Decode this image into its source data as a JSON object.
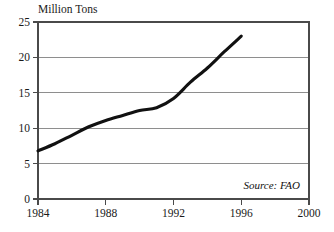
{
  "chart_data": {
    "type": "line",
    "title": "",
    "subtitle": "",
    "xlabel": "",
    "ylabel": "Million Tons",
    "ylabel_position": "top-left-above-axis",
    "xlim": [
      1984,
      2000
    ],
    "ylim": [
      0,
      25
    ],
    "grid": "horizontal",
    "legend": "none",
    "x": [
      1984,
      1985,
      1986,
      1987,
      1988,
      1989,
      1990,
      1991,
      1992,
      1993,
      1994,
      1995,
      1996
    ],
    "series": [
      {
        "name": "Production",
        "color": "#111111",
        "values": [
          6.8,
          7.8,
          9.0,
          10.2,
          11.1,
          11.8,
          12.5,
          12.9,
          14.2,
          16.5,
          18.5,
          20.8,
          23.0
        ]
      }
    ],
    "x_ticks": [
      1984,
      1988,
      1992,
      1996,
      2000
    ],
    "x_tick_labels": [
      "1984",
      "1988",
      "1992",
      "1996",
      "2000"
    ],
    "y_ticks": [
      0,
      5,
      10,
      15,
      20,
      25
    ],
    "y_tick_labels": [
      "0",
      "5",
      "10",
      "15",
      "20",
      "25"
    ],
    "annotations": [
      {
        "name": "source-note",
        "text": "Source: FAO",
        "style": "italic",
        "position": "bottom-right-inside-plot"
      }
    ]
  },
  "labels": {
    "y_axis_title": "Million Tons",
    "source": "Source: FAO",
    "y_0": "0",
    "y_5": "5",
    "y_10": "10",
    "y_15": "15",
    "y_20": "20",
    "y_25": "25",
    "x_1984": "1984",
    "x_1988": "1988",
    "x_1992": "1992",
    "x_1996": "1996",
    "x_2000": "2000"
  },
  "colors": {
    "line": "#111111",
    "grid": "#8e8e8e",
    "frame": "#4a4a4a",
    "background": "#ffffff",
    "text": "#1a1a1a"
  }
}
